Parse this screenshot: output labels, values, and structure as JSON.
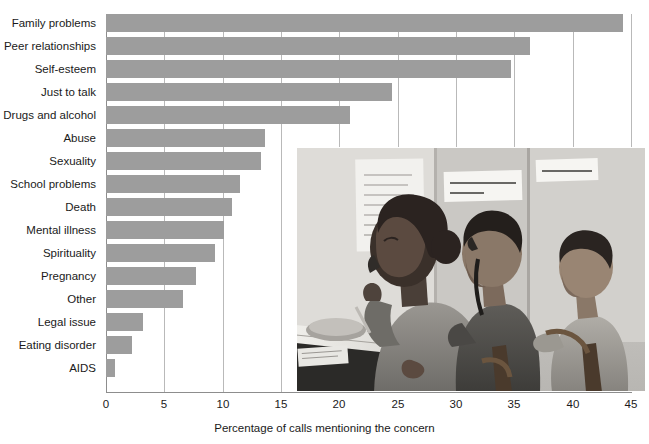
{
  "chart_data": {
    "type": "bar",
    "orientation": "horizontal",
    "title": "",
    "xlabel": "Percentage of calls mentioning the concern",
    "ylabel": "",
    "xlim": [
      0,
      45
    ],
    "xticks": [
      0,
      5,
      10,
      15,
      20,
      25,
      30,
      35,
      40,
      45
    ],
    "grid": "vertical",
    "legend": "none",
    "bar_color": "#9d9d9d",
    "categories": [
      "Family problems",
      "Peer relationships",
      "Self-esteem",
      "Just to talk",
      "Drugs and alcohol",
      "Abuse",
      "Sexuality",
      "School problems",
      "Death",
      "Mental illness",
      "Spirituality",
      "Pregnancy",
      "Other",
      "Legal issue",
      "Eating disorder",
      "AIDS"
    ],
    "values": [
      44.3,
      36.3,
      34.7,
      24.5,
      20.9,
      13.6,
      13.3,
      11.5,
      10.8,
      10.1,
      9.3,
      7.7,
      6.6,
      3.2,
      2.2,
      0.8
    ]
  },
  "axis": {
    "x_title": "Percentage of calls mentioning the concern",
    "tick_labels": [
      "0",
      "5",
      "10",
      "15",
      "20",
      "25",
      "30",
      "35",
      "40",
      "45"
    ]
  },
  "photo": {
    "name": "hotline-call-center-photograph",
    "description": "Black and white photograph of three volunteers answering telephones at a crisis hotline; a young woman in the foreground writes on a notepad while on the phone, two young men sit behind her on phones, handwritten signs are taped to the wall.",
    "signs": [
      "LISTEN WITH CARE! SAVE A LIFE!",
      "SMILE AS YOU CALL"
    ]
  }
}
